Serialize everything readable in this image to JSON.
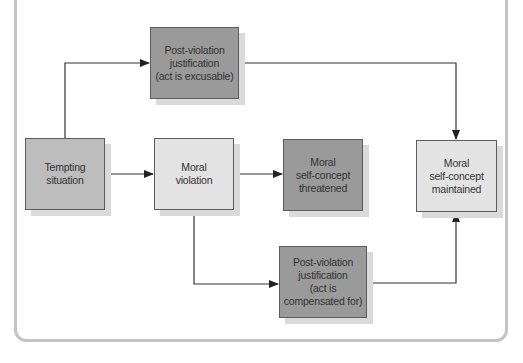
{
  "diagram": {
    "nodes": [
      {
        "id": "tempting",
        "label": "Tempting\nsituation",
        "shade": "#bdbdbd"
      },
      {
        "id": "violation",
        "label": "Moral\nviolation",
        "shade": "#e3e3e3"
      },
      {
        "id": "threatened",
        "label": "Moral\nself-concept\nthreatened",
        "shade": "#9a9a9a"
      },
      {
        "id": "maintained",
        "label": "Moral\nself-concept\nmaintained",
        "shade": "#e3e3e3"
      },
      {
        "id": "excusable",
        "label": "Post-violation\njustification\n(act is excusable)",
        "shade": "#9a9a9a"
      },
      {
        "id": "compensated",
        "label": "Post-violation\njustification\n(act is\ncompensated for)",
        "shade": "#9a9a9a"
      }
    ],
    "edges": [
      {
        "from": "tempting",
        "to": "excusable"
      },
      {
        "from": "excusable",
        "to": "maintained"
      },
      {
        "from": "tempting",
        "to": "violation"
      },
      {
        "from": "violation",
        "to": "threatened"
      },
      {
        "from": "violation",
        "to": "compensated"
      },
      {
        "from": "compensated",
        "to": "maintained"
      }
    ]
  }
}
